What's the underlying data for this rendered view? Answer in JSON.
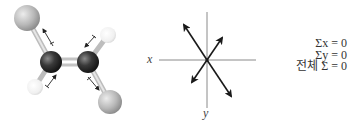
{
  "molecule": {
    "description": "planar molecule with two central dark atoms double-bonded, two gray and two white substituents, with bond dipole arrows",
    "atoms": [
      {
        "name": "gray-atom-top-left",
        "cx": 27,
        "cy": 18,
        "r": 13,
        "color": "#b5b5b5"
      },
      {
        "name": "carbon-atom-left",
        "cx": 51,
        "cy": 62,
        "r": 11,
        "color": "#2e2e2e"
      },
      {
        "name": "carbon-atom-right",
        "cx": 88,
        "cy": 62,
        "r": 11,
        "color": "#2e2e2e"
      },
      {
        "name": "white-atom-top-right",
        "cx": 108,
        "cy": 35,
        "r": 8,
        "color": "#f2f2f2"
      },
      {
        "name": "white-atom-bottom-left",
        "cx": 35,
        "cy": 87,
        "r": 8,
        "color": "#f2f2f2"
      },
      {
        "name": "gray-atom-bottom-right",
        "cx": 110,
        "cy": 102,
        "r": 12,
        "color": "#b5b5b5"
      }
    ]
  },
  "vector_diagram": {
    "x_label": "x",
    "y_label": "y",
    "center": [
      207,
      60
    ],
    "vectors": [
      {
        "name": "vector-upper-left",
        "to": [
          183,
          23
        ]
      },
      {
        "name": "vector-upper-right",
        "to": [
          223,
          37
        ]
      },
      {
        "name": "vector-lower-left",
        "to": [
          191,
          83
        ]
      },
      {
        "name": "vector-lower-right",
        "to": [
          232,
          98
        ]
      }
    ]
  },
  "equations": {
    "sum_x": "Σx = 0",
    "sum_y": "Σy = 0",
    "sum_total": "전체 Σ = 0"
  },
  "colors": {
    "axis": "#888888",
    "arrow": "#1a1a1a",
    "bond": "#cfcfcf",
    "text": "#333333"
  }
}
